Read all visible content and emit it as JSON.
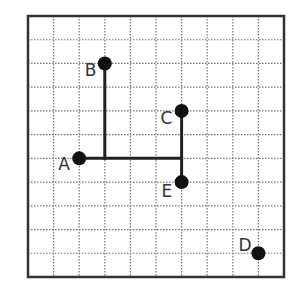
{
  "diagram": {
    "type": "coordinate-grid",
    "columns": 10,
    "rows": 11,
    "colors": {
      "frame": "#333333",
      "grid": "#777777",
      "segment": "#222222",
      "point": "#111111",
      "label": "#333333"
    },
    "points": [
      {
        "id": "A",
        "label": "A",
        "col": 2,
        "row": 6,
        "label_dx": -21,
        "label_dy": 12
      },
      {
        "id": "B",
        "label": "B",
        "col": 3,
        "row": 2,
        "label_dx": -20,
        "label_dy": 13
      },
      {
        "id": "C",
        "label": "C",
        "col": 6,
        "row": 4,
        "label_dx": -21,
        "label_dy": 13
      },
      {
        "id": "D",
        "label": "D",
        "col": 9,
        "row": 10,
        "label_dx": -20,
        "label_dy": -2
      },
      {
        "id": "E",
        "label": "E",
        "col": 6,
        "row": 7,
        "label_dx": -20,
        "label_dy": 15
      }
    ],
    "segments": [
      {
        "from": [
          3,
          2
        ],
        "to": [
          3,
          6
        ]
      },
      {
        "from": [
          2,
          6
        ],
        "to": [
          6,
          6
        ]
      },
      {
        "from": [
          6,
          4
        ],
        "to": [
          6,
          7
        ]
      }
    ]
  }
}
